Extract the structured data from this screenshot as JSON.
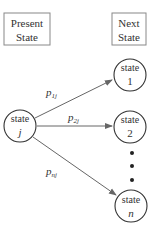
{
  "labels": {
    "present_state_line1": "Present",
    "present_state_line2": "State",
    "next_state_line1": "Next",
    "next_state_line2": "State"
  },
  "nodes": {
    "present": {
      "line1": "state",
      "line2": "j"
    },
    "next1": {
      "line1": "state",
      "line2": "1"
    },
    "next2": {
      "line1": "state",
      "line2": "2"
    },
    "nextn": {
      "line1": "state",
      "line2": "n"
    }
  },
  "edges": {
    "p1j": {
      "base": "p",
      "sub": "1j"
    },
    "p2j": {
      "base": "p",
      "sub": "2j"
    },
    "pnj": {
      "base": "p",
      "sub": "nj"
    }
  },
  "colors": {
    "stroke": "#333333",
    "arrow": "#666666",
    "box": "#888888"
  }
}
